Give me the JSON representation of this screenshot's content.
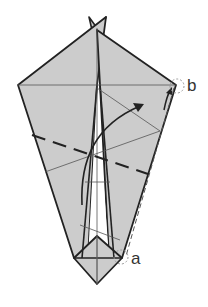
{
  "diagram": {
    "type": "origami-fold-diagram",
    "labels": {
      "a": "a",
      "b": "b"
    },
    "colors": {
      "paper": "#cccccc",
      "line": "#222222",
      "thin_line": "#555555",
      "background": "#ffffff"
    },
    "annotations": [
      {
        "id": "a",
        "text": "a",
        "marker": "dashed-circle",
        "position": "bottom-right vertex"
      },
      {
        "id": "b",
        "text": "b",
        "marker": "dashed-circle",
        "position": "right corner"
      }
    ],
    "instruction": "Fold point a up to point b along the dashed valley fold"
  }
}
